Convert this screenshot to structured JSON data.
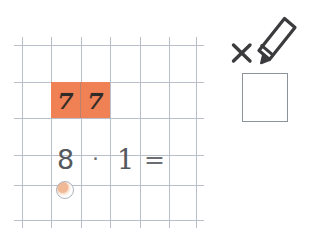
{
  "worksheet": {
    "name": "squared-paper-math-exercise",
    "grid": {
      "columns": 6,
      "rows": 5,
      "cell_size_px": 29,
      "line_color": "#b9bfc9"
    },
    "highlight": {
      "color": "#ef8155",
      "cells": 2,
      "description": "orange highlighted two-cell block"
    },
    "top_row": {
      "digit_1": "7",
      "digit_2": "7"
    },
    "equation_row": {
      "operand_1": "8",
      "operator": "·",
      "operand_2": "1",
      "equals": "="
    },
    "marker": {
      "shape": "circle",
      "fill_color": "#f0b894"
    }
  },
  "tool_panel": {
    "multiply_symbol": "×",
    "pencil_icon_name": "pencil-icon",
    "answer_box_value": "",
    "answer_box_placeholder": ""
  },
  "colors": {
    "highlight_orange": "#ef8155",
    "grid_line": "#b9bfc9",
    "ink": "#55585c",
    "box_border": "#8d939b",
    "background": "#ffffff"
  }
}
